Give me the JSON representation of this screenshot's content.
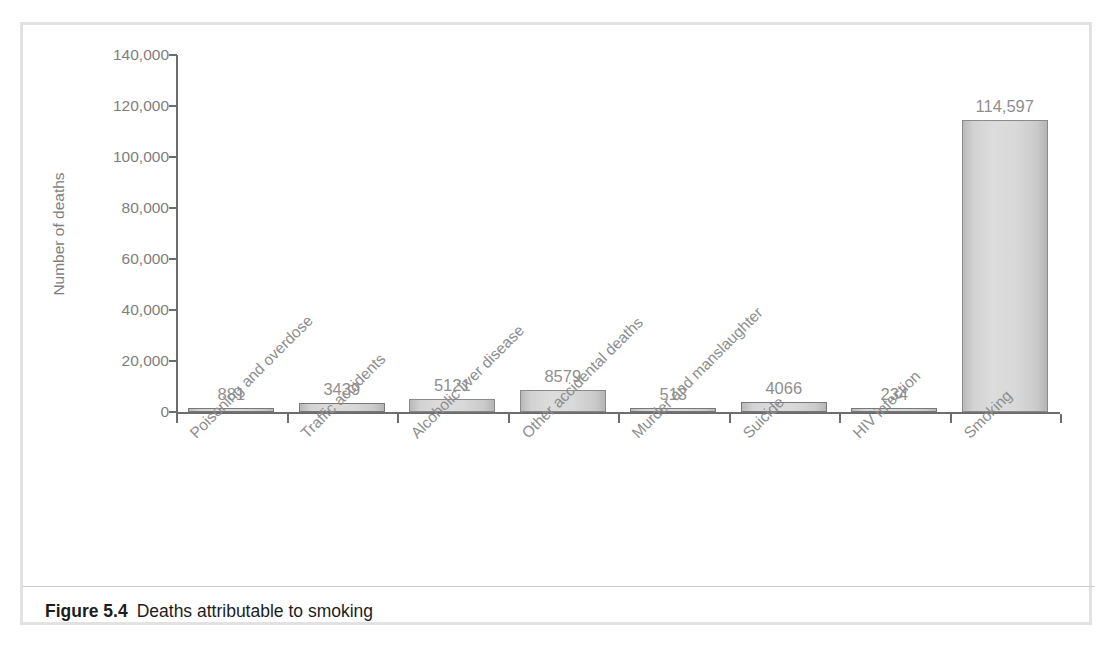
{
  "figure": {
    "caption_number": "Figure 5.4",
    "caption_text": "Deaths attributable to smoking"
  },
  "chart_data": {
    "type": "bar",
    "title": "Deaths attributable to smoking",
    "xlabel": "",
    "ylabel": "Number of deaths",
    "ylim": [
      0,
      140000
    ],
    "grid": false,
    "legend": null,
    "categories": [
      "Poisoning and overdose",
      "Traffic accidents",
      "Alcoholic liver disease",
      "Other accidental deaths",
      "Murder and manslaughter",
      "Suicide",
      "HIV infection",
      "Smoking"
    ],
    "values": [
      881,
      3439,
      5121,
      8579,
      513,
      4066,
      234,
      114597
    ],
    "value_labels": [
      "881",
      "3439",
      "5121",
      "8579",
      "513",
      "4066",
      "234",
      "114,597"
    ],
    "y_ticks": [
      0,
      20000,
      40000,
      60000,
      80000,
      100000,
      120000,
      140000
    ],
    "y_tick_labels": [
      "0",
      "20,000",
      "40,000",
      "60,000",
      "80,000",
      "100,000",
      "120,000",
      "140,000"
    ],
    "colors": {
      "bar_fill_light": "#dcdcdc",
      "bar_fill_dark": "#b4b4b4",
      "bar_stroke": "#8a8a8a",
      "axis": "#6d6d6d",
      "tick_text": "#7e7e7e",
      "label_text": "#8f8f8f",
      "frame_border": "#e2e2e2"
    }
  }
}
